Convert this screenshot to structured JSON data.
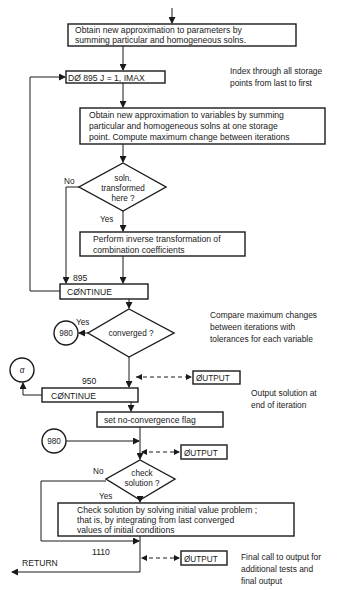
{
  "flowchart": {
    "top_box": {
      "lines": [
        "Obtain new approximation to parameters by",
        "summing particular and homogeneous solns."
      ]
    },
    "do_loop": {
      "label": "DØ 895 J = 1, IMAX"
    },
    "note_index": {
      "lines": [
        "Index through all storage",
        "points from last to first"
      ]
    },
    "variables_box": {
      "lines": [
        "Obtain new approximation to variables by summing",
        "particular and homogeneous solns at one storage",
        "point. Compute maximum change between iterations"
      ]
    },
    "decision_transformed": {
      "lines": [
        "soln.",
        "transformed",
        "here ?"
      ],
      "no_label": "No",
      "yes_label": "Yes"
    },
    "inverse_box": {
      "lines": [
        "Perform inverse transformation of",
        "combination coefficients"
      ]
    },
    "continue_895": {
      "statement_number": "895",
      "label": "CØNTINUE"
    },
    "decision_converged": {
      "label": "converged ?",
      "yes_label": "Yes",
      "connector": "980"
    },
    "note_compare": {
      "lines": [
        "Compare maximum changes",
        "between iterations with",
        "tolerances for each variable"
      ]
    },
    "connector_alpha": {
      "label": "α"
    },
    "output_1": {
      "label": "ØUTPUT"
    },
    "continue_950": {
      "statement_number": "950",
      "label": "CØNTINUE"
    },
    "note_output": {
      "lines": [
        "Output solution at",
        "end of iteration"
      ]
    },
    "flag_box": {
      "label": "set no-convergence flag"
    },
    "connector_980": {
      "label": "980"
    },
    "output_2": {
      "label": "ØUTPUT"
    },
    "decision_check": {
      "lines": [
        "check",
        "solution ?"
      ],
      "no_label": "No",
      "yes_label": "Yes"
    },
    "check_box": {
      "lines": [
        "Check solution by solving initial value problem ;",
        "that is, by integrating from last converged",
        "values of initial conditions"
      ]
    },
    "statement_1110": "1110",
    "output_3": {
      "label": "ØUTPUT"
    },
    "return_label": "RETURN",
    "note_final": {
      "lines": [
        "Final call to output for",
        "additional tests and",
        "final output"
      ]
    }
  }
}
